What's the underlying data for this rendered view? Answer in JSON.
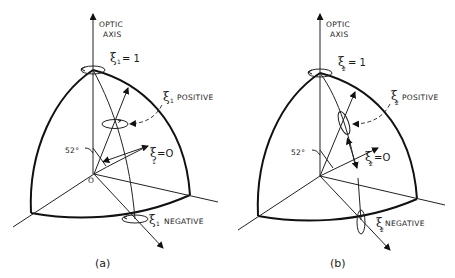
{
  "figure": {
    "panels": [
      {
        "id": "a",
        "caption": "(a)",
        "axis_label_line1": "OPTIC",
        "axis_label_line2": "AXIS",
        "xi_symbol": "ξ",
        "subscript": "1",
        "top_label_eq": "= 1",
        "positive_label": "POSITIVE",
        "zero_label_eq": "=O",
        "negative_label": "NEGATIVE",
        "angle_label": "52°",
        "origin_label": "O"
      },
      {
        "id": "b",
        "caption": "(b)",
        "axis_label_line1": "OPTIC",
        "axis_label_line2": "AXIS",
        "xi_symbol": "ξ",
        "subscript": "2",
        "top_label_eq": "= 1",
        "positive_label": "POSITIVE",
        "zero_label_eq": "=O",
        "negative_label": "NEGATIVE",
        "angle_label": "52°",
        "origin_label": "O"
      }
    ]
  }
}
